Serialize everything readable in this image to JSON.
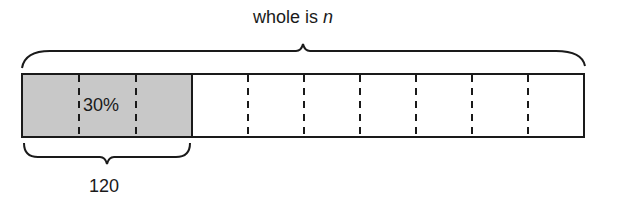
{
  "diagram": {
    "type": "tape-diagram",
    "top_label": {
      "prefix": "whole is ",
      "variable": "n"
    },
    "bar": {
      "segments": 10,
      "shaded_segments": 3,
      "shaded_label": "30%",
      "colors": {
        "shaded": "#c8c8c8",
        "unshaded": "#ffffff",
        "stroke": "#1a1a1a"
      }
    },
    "bottom_label": "120"
  }
}
